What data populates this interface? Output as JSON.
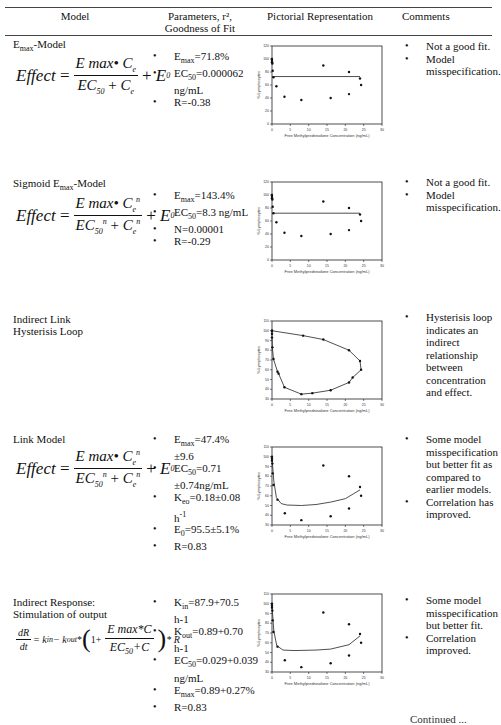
{
  "header": {
    "col_model": "Model",
    "col_params_line1": "Parameters, r², ",
    "col_params_line2": "Goodness of Fit",
    "col_picture": "Pictorial Representation",
    "col_comments": "Comments"
  },
  "rows": [
    {
      "title": "Emax-Model",
      "title_main": "E",
      "title_sub": "max",
      "title_rest": "-Model",
      "formula": "Effect = Emax•Ce / (EC50 + Ce) + E0",
      "params": [
        "Emax=71.8%",
        "EC50=0.000062 ng/mL",
        "R=-0.38"
      ],
      "comments": [
        "Not a good fit.",
        "Model misspecification."
      ]
    },
    {
      "title": "Sigmoid Emax-Model",
      "title_main": "Sigmoid E",
      "title_sub": "max",
      "title_rest": "-Model",
      "formula": "Effect = Emax•Ce^n / (EC50^n + Ce^n) + E0",
      "params": [
        "Emax=143.4%",
        "EC50=8.3 ng/mL",
        "N=0.00001",
        "R=-0.29"
      ],
      "comments": [
        "Not a good fit.",
        "Model misspecification."
      ]
    },
    {
      "title_line1": "Indirect Link",
      "title_line2": "Hysterisis Loop",
      "params": [],
      "comments": [
        "Hysterisis loop indicates an indirect relationship between concentration and effect."
      ]
    },
    {
      "title": "Link Model",
      "formula": "Effect = Emax•Ce^n / (EC50^n + Ce^n) + E0",
      "params": [
        "Emax=47.4% ±9.6",
        "EC50=0.71 ±0.74ng/mL",
        "Keo=0.18±0.08 h-1",
        "E0=95.5±5.1%",
        "R=0.83"
      ],
      "comments": [
        "Some model misspecification but better fit as compared to earlier models.",
        "Correlation has improved."
      ]
    },
    {
      "title_line1": "Indirect Response:",
      "title_line2": "Stimulation of output",
      "formula": "dR/dt = kin - kout*(1 + Emax*C/(EC50+C))*R",
      "params": [
        "Kin=87.9+70.5 h-1",
        "Kout=0.89+0.70 h-1",
        "EC50=0.029+0.039 ng/mL",
        "Emax=0.89+0.27%",
        "R=0.83"
      ],
      "comments": [
        "Some model misspecification but better fit.",
        "Correlation improved."
      ]
    }
  ],
  "formula_parts": {
    "effect": "Effect",
    "eq": "=",
    "emax": "E max•",
    "c": "C",
    "e": "e",
    "n": "n",
    "ec": "EC",
    "s50": "50",
    "plus": "+",
    "e0": "E",
    "zero": "0",
    "ir_lhs_num": "dR",
    "ir_lhs_den": "dt",
    "ir_mid": "= k",
    "ir_in": "in",
    "ir_minus": " − k",
    "ir_out": "out",
    "ir_star": "*",
    "ir_one": "1+",
    "ir_num": "E max*C",
    "ir_den": "EC",
    "ir_den_rest": "+C",
    "ir_r": "* R"
  },
  "params_display": {
    "r0": [
      {
        "a": "E",
        "s": "max",
        "b": "=71.8%"
      },
      {
        "a": "EC",
        "s": "50",
        "b": "=0.000062 ng/mL"
      },
      {
        "a": "R=-0.38",
        "s": "",
        "b": ""
      }
    ],
    "r1": [
      {
        "a": "E",
        "s": "max",
        "b": "=143.4%"
      },
      {
        "a": "EC",
        "s": "50",
        "b": "=8.3 ng/mL"
      },
      {
        "a": "N=0.00001",
        "s": "",
        "b": ""
      },
      {
        "a": "R=-0.29",
        "s": "",
        "b": ""
      }
    ],
    "r3": [
      {
        "a": "E",
        "s": "max",
        "b": "=47.4% ±9.6"
      },
      {
        "a": "EC",
        "s": "50",
        "b": "=0.71 ±0.74ng/mL"
      },
      {
        "a": "K",
        "s": "eo",
        "b": "=0.18±0.08 h",
        "sup": "-1"
      },
      {
        "a": "E",
        "s": "0",
        "b": "=95.5±5.1%"
      },
      {
        "a": "R=0.83",
        "s": "",
        "b": ""
      }
    ],
    "r4": [
      {
        "a": "K",
        "s": "in",
        "b": "=87.9+70.5 h-1"
      },
      {
        "a": "K",
        "s": "out",
        "b": "=0.89+0.70 h-1"
      },
      {
        "a": "EC",
        "s": "50",
        "b": "=0.029+0.039 ng/mL"
      },
      {
        "a": "E",
        "s": "max",
        "b": "=0.89+0.27%"
      },
      {
        "a": "R=0.83",
        "s": "",
        "b": ""
      }
    ]
  },
  "chart_data": [
    {
      "type": "scatter",
      "title": "Emax-Model fit",
      "xlabel": "Free Methylprednisolone Concentration (ng/mL)",
      "ylabel": "% Lymphocytes",
      "xlim": [
        0,
        30
      ],
      "ylim": [
        0,
        120
      ],
      "xticks": [
        0,
        5,
        10,
        15,
        20,
        25,
        30
      ],
      "yticks": [
        0,
        20,
        40,
        60,
        80,
        100,
        120
      ],
      "points": [
        [
          0,
          100
        ],
        [
          0,
          97
        ],
        [
          0,
          95
        ],
        [
          0.1,
          93
        ],
        [
          0.2,
          82
        ],
        [
          0.4,
          72
        ],
        [
          1.2,
          58
        ],
        [
          3.4,
          42
        ],
        [
          8,
          37
        ],
        [
          14,
          90
        ],
        [
          16,
          40
        ],
        [
          21,
          80
        ],
        [
          21,
          46
        ],
        [
          24,
          70
        ],
        [
          24.3,
          60
        ]
      ],
      "fit_line": [
        [
          0,
          73
        ],
        [
          24,
          73
        ]
      ]
    },
    {
      "type": "scatter",
      "title": "Sigmoid Emax-Model fit",
      "xlabel": "Free Methylprednisolone Concentration (ng/mL)",
      "ylabel": "% Lymphocytes",
      "xlim": [
        0,
        30
      ],
      "ylim": [
        0,
        120
      ],
      "xticks": [
        0,
        5,
        10,
        15,
        20,
        25,
        30
      ],
      "yticks": [
        0,
        20,
        40,
        60,
        80,
        100,
        120
      ],
      "points": [
        [
          0,
          100
        ],
        [
          0,
          97
        ],
        [
          0,
          95
        ],
        [
          0.1,
          93
        ],
        [
          0.2,
          82
        ],
        [
          0.4,
          72
        ],
        [
          1.2,
          58
        ],
        [
          3.4,
          42
        ],
        [
          8,
          37
        ],
        [
          14,
          90
        ],
        [
          16,
          40
        ],
        [
          21,
          80
        ],
        [
          21,
          46
        ],
        [
          24,
          70
        ],
        [
          24.3,
          60
        ]
      ],
      "fit_line": [
        [
          0,
          72
        ],
        [
          24,
          72
        ]
      ]
    },
    {
      "type": "line",
      "title": "Indirect Link Hysterisis Loop",
      "xlabel": "Free Methylprednisolone Concentration (ng/mL)",
      "ylabel": "% Lymphocytes",
      "xlim": [
        0,
        30
      ],
      "ylim": [
        30,
        110
      ],
      "xticks": [
        0,
        5,
        10,
        15,
        20,
        25,
        30
      ],
      "yticks": [
        30,
        40,
        50,
        60,
        70,
        80,
        90,
        100,
        110
      ],
      "points": [
        [
          0,
          100
        ],
        [
          8.5,
          95
        ],
        [
          14,
          91
        ],
        [
          21,
          80
        ],
        [
          24,
          69
        ],
        [
          24.3,
          60
        ],
        [
          22,
          52
        ],
        [
          21,
          47
        ],
        [
          16,
          39
        ],
        [
          11,
          36
        ],
        [
          8,
          35
        ],
        [
          3.4,
          42
        ],
        [
          1.8,
          56
        ],
        [
          1.5,
          58
        ],
        [
          0.4,
          71
        ],
        [
          0.1,
          83
        ],
        [
          0,
          93
        ],
        [
          0,
          97
        ],
        [
          0,
          100
        ]
      ]
    },
    {
      "type": "scatter",
      "title": "Link Model fit",
      "xlabel": "Free Methylprednisolone Concentration (ng/mL)",
      "ylabel": "% Lymphocytes",
      "xlim": [
        0,
        30
      ],
      "ylim": [
        30,
        110
      ],
      "xticks": [
        0,
        5,
        10,
        15,
        20,
        25,
        30
      ],
      "yticks": [
        30,
        40,
        50,
        60,
        70,
        80,
        90,
        100,
        110
      ],
      "points": [
        [
          0,
          100
        ],
        [
          0,
          98
        ],
        [
          0,
          96
        ],
        [
          0.1,
          93
        ],
        [
          0.2,
          83
        ],
        [
          0.4,
          71
        ],
        [
          1.5,
          56
        ],
        [
          3.5,
          42
        ],
        [
          8,
          35
        ],
        [
          14,
          91
        ],
        [
          16,
          39
        ],
        [
          21,
          80
        ],
        [
          21,
          47
        ],
        [
          24,
          69
        ],
        [
          24.3,
          60
        ]
      ],
      "fit_line": [
        [
          0,
          98
        ],
        [
          0.5,
          75
        ],
        [
          1.2,
          58
        ],
        [
          2.5,
          52
        ],
        [
          4,
          50.5
        ],
        [
          8,
          50
        ],
        [
          12,
          51
        ],
        [
          16,
          53.5
        ],
        [
          20,
          57
        ],
        [
          24,
          66
        ]
      ]
    },
    {
      "type": "scatter",
      "title": "Indirect Response fit",
      "xlabel": "Free Methylprednisolone Concentration (ng/mL)",
      "ylabel": "% Lymphocytes",
      "xlim": [
        0,
        30
      ],
      "ylim": [
        30,
        110
      ],
      "xticks": [
        0,
        5,
        10,
        15,
        20,
        25,
        30
      ],
      "yticks": [
        30,
        40,
        50,
        60,
        70,
        80,
        90,
        100,
        110
      ],
      "points": [
        [
          0,
          100
        ],
        [
          0,
          98
        ],
        [
          0,
          96
        ],
        [
          0.1,
          93
        ],
        [
          0.2,
          83
        ],
        [
          0.4,
          71
        ],
        [
          1.5,
          56
        ],
        [
          3.5,
          42
        ],
        [
          8,
          35
        ],
        [
          14,
          91
        ],
        [
          16,
          39
        ],
        [
          21,
          79
        ],
        [
          21,
          47
        ],
        [
          24,
          69
        ],
        [
          24.3,
          60
        ]
      ],
      "fit_line": [
        [
          0,
          98
        ],
        [
          0.5,
          72
        ],
        [
          1.3,
          57
        ],
        [
          3,
          52.5
        ],
        [
          6,
          52
        ],
        [
          12,
          52.5
        ],
        [
          16,
          53.5
        ],
        [
          21,
          58
        ],
        [
          24,
          67
        ]
      ]
    }
  ],
  "footer": {
    "cutoff_text": "Continued ..."
  }
}
